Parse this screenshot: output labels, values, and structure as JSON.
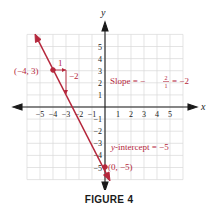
{
  "chart_data": {
    "type": "line",
    "title": "",
    "caption": "FIGURE 4",
    "xlabel": "x",
    "ylabel": "y",
    "xlim": [
      -6,
      6
    ],
    "ylim": [
      -6,
      6
    ],
    "grid": true,
    "x_ticks": [
      -5,
      -4,
      -3,
      -2,
      -1,
      1,
      2,
      3,
      4,
      5
    ],
    "y_ticks": [
      -5,
      -4,
      -3,
      -2,
      -1,
      1,
      2,
      3,
      4,
      5
    ],
    "series": [
      {
        "name": "y = -2x - 5",
        "color": "#b5273c",
        "points": [
          [
            -5.5,
            6
          ],
          [
            0.5,
            -6
          ]
        ],
        "equation": "y = -2x - 5"
      }
    ],
    "marked_points": [
      {
        "x": -4,
        "y": 3,
        "label": "(−4, 3)"
      },
      {
        "x": 0,
        "y": -5,
        "label": "(0, −5)"
      }
    ],
    "annotations": [
      {
        "text": "Slope = − 2/1 = −2",
        "type": "slope"
      },
      {
        "text": "y-intercept = −5",
        "type": "intercept"
      },
      {
        "text": "1",
        "type": "run"
      },
      {
        "text": "−2",
        "type": "rise"
      }
    ]
  },
  "labels": {
    "x_axis": "x",
    "y_axis": "y",
    "point_a": "(−4, 3)",
    "point_b": "(0, −5)",
    "run": "1",
    "rise": "−2",
    "slope_prefix": "Slope = −",
    "slope_num": "2",
    "slope_den": "1",
    "slope_suffix": "= −2",
    "intercept_y": "y",
    "intercept_rest": "-intercept = −5",
    "caption": "FIGURE 4"
  },
  "colors": {
    "accent": "#b5273c",
    "axis": "#1a1a1a",
    "grid": "#d9d9d9"
  }
}
